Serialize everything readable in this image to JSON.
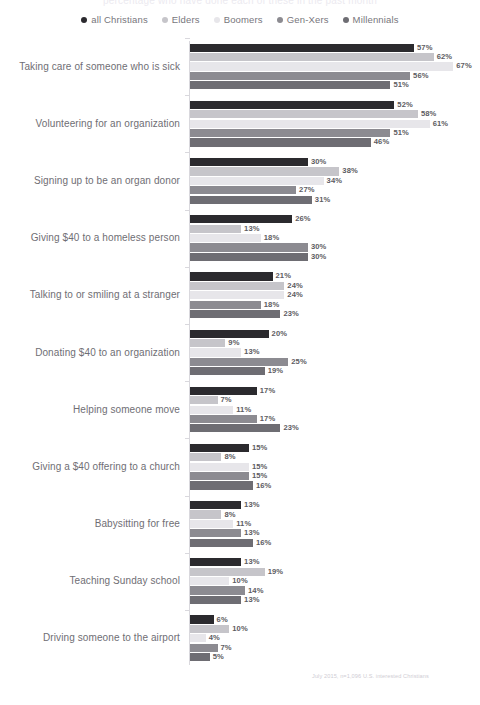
{
  "title_cropped": "percentage who have done each of these in the past month",
  "footnote": "July 2015, n=1,096 U.S. interested Christians",
  "legend": {
    "position": "top-center",
    "items": [
      {
        "label": "all Christians",
        "color": "#2b2a2e"
      },
      {
        "label": "Elders",
        "color": "#c6c5ca"
      },
      {
        "label": "Boomers",
        "color": "#e7e6ea"
      },
      {
        "label": "Gen-Xers",
        "color": "#8c8b91"
      },
      {
        "label": "Millennials",
        "color": "#6e6d73"
      }
    ]
  },
  "chart_data": {
    "type": "bar",
    "orientation": "horizontal",
    "title": "percentage who have done each of these in the past month",
    "xlabel": "",
    "ylabel": "",
    "xlim": [
      0,
      70
    ],
    "grid": false,
    "legend_position": "top-center",
    "value_suffix": "%",
    "categories": [
      "Taking care of someone who is sick",
      "Volunteering for an organization",
      "Signing up to be an organ donor",
      "Giving $40 to a homeless person",
      "Talking to or smiling at a stranger",
      "Donating $40 to an organization",
      "Helping someone move",
      "Giving a $40 offering to a church",
      "Babysitting for free",
      "Teaching Sunday school",
      "Driving someone to the airport"
    ],
    "series": [
      {
        "name": "all Christians",
        "color": "#2b2a2e",
        "values": [
          57,
          52,
          30,
          26,
          21,
          20,
          17,
          15,
          13,
          13,
          6
        ]
      },
      {
        "name": "Elders",
        "color": "#c6c5ca",
        "values": [
          62,
          58,
          38,
          13,
          24,
          9,
          7,
          8,
          8,
          19,
          10
        ]
      },
      {
        "name": "Boomers",
        "color": "#e7e6ea",
        "values": [
          67,
          61,
          34,
          18,
          24,
          13,
          11,
          15,
          11,
          10,
          4
        ]
      },
      {
        "name": "Gen-Xers",
        "color": "#8c8b91",
        "values": [
          56,
          51,
          27,
          30,
          18,
          25,
          17,
          15,
          13,
          14,
          7
        ]
      },
      {
        "name": "Millennials",
        "color": "#6e6d73",
        "values": [
          51,
          46,
          31,
          30,
          23,
          19,
          23,
          16,
          16,
          13,
          5
        ]
      }
    ]
  }
}
